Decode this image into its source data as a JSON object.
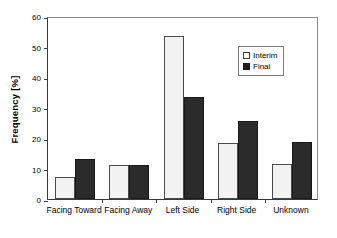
{
  "chart_data": {
    "type": "bar",
    "title": "",
    "subtitle": "",
    "xlabel": "",
    "ylabel": "Frequency [%]",
    "categories": [
      "Facing Toward",
      "Facing Away",
      "Left Side",
      "Right Side",
      "Unknown"
    ],
    "series": [
      {
        "name": "Interim",
        "values": [
          7.2,
          11.1,
          53.4,
          18.5,
          11.6
        ],
        "color": "#f2f2f2"
      },
      {
        "name": "Final",
        "values": [
          13.1,
          11.2,
          33.3,
          25.6,
          18.6
        ],
        "color": "#2b2b2b"
      }
    ],
    "ylim": [
      0,
      60
    ],
    "yticks": [
      0,
      10,
      20,
      30,
      40,
      50,
      60
    ],
    "ytick_labels": [
      "0",
      "10",
      "20",
      "30",
      "40",
      "50",
      "60"
    ],
    "grid": false,
    "legend_position": "upper-right",
    "legend_entries": [
      "Interim",
      "Final"
    ]
  },
  "axes": {
    "y_title": "Frequency [%]"
  },
  "legend": {
    "items": [
      {
        "label": "Interim"
      },
      {
        "label": "Final"
      }
    ]
  }
}
